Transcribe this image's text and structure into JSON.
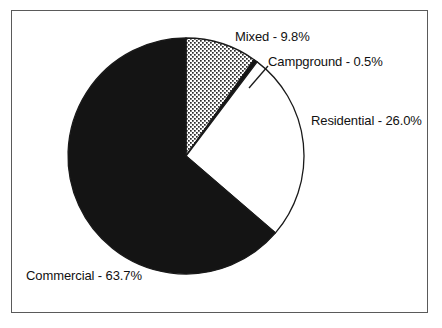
{
  "chart_data": {
    "type": "pie",
    "title": "",
    "subtitle": "",
    "xlabel": "",
    "ylabel": "",
    "legend_position": "none",
    "grid": false,
    "start_angle_deg": 0,
    "direction": "clockwise",
    "categories": [
      "Mixed",
      "Campground",
      "Residential",
      "Commercial"
    ],
    "values": [
      9.8,
      0.5,
      26.0,
      63.7
    ],
    "unit": "%",
    "slices": [
      {
        "name": "Mixed",
        "value": 9.8,
        "label": "Mixed - 9.8%",
        "fill": "dotted-stipple",
        "fill_color": "#ffffff",
        "start_deg": 0.0,
        "end_deg": 35.28
      },
      {
        "name": "Campground",
        "value": 0.5,
        "label": "Campground - 0.5%",
        "fill": "solid-black",
        "fill_color": "#141414",
        "start_deg": 35.28,
        "end_deg": 37.08
      },
      {
        "name": "Residential",
        "value": 26.0,
        "label": "Residential - 26.0%",
        "fill": "solid-white",
        "fill_color": "#ffffff",
        "start_deg": 37.08,
        "end_deg": 130.68
      },
      {
        "name": "Commercial",
        "value": 63.7,
        "label": "Commercial - 63.7%",
        "fill": "solid-black",
        "fill_color": "#141414",
        "start_deg": 130.68,
        "end_deg": 360.0
      }
    ],
    "geometry": {
      "center_x": 186,
      "center_y": 156,
      "radius": 118
    },
    "colors": {
      "outline": "#1a1a1a",
      "black_slice": "#141414",
      "white_slice": "#ffffff",
      "frame": "#5a5a5a",
      "text": "#111111",
      "background": "#ffffff"
    }
  },
  "labels": {
    "mixed": "Mixed - 9.8%",
    "campground": "Campground - 0.5%",
    "residential": "Residential - 26.0%",
    "commercial": "Commercial - 63.7%"
  }
}
